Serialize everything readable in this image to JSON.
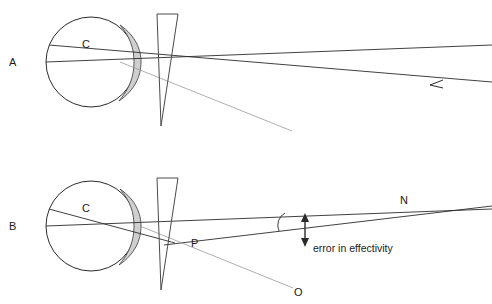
{
  "figure": {
    "title": "",
    "background_color": "#ffffff",
    "stroke_color": "#2b2b2b",
    "faint_stroke_color": "#9a9a9a",
    "cornea_fill_color": "#d0d0d0",
    "panels": [
      {
        "id": "A",
        "label": "A",
        "label_x": 12,
        "label_y": 66,
        "description": "eye with cornea, prism, and two parallel incoming rays"
      },
      {
        "id": "B",
        "label": "B",
        "label_x": 12,
        "label_y": 226,
        "description": "eye with cornea, prism, converging rays meeting at N, points P and O, error in effectivity annotation"
      }
    ],
    "point_labels": [
      {
        "text": "C",
        "x": 86,
        "y": 48,
        "panel": "A"
      },
      {
        "text": "C",
        "x": 86,
        "y": 212,
        "panel": "B"
      },
      {
        "text": "P",
        "x": 193,
        "y": 247,
        "panel": "B"
      },
      {
        "text": "N",
        "x": 402,
        "y": 204,
        "panel": "B"
      },
      {
        "text": "O",
        "x": 296,
        "y": 295,
        "panel": "B"
      }
    ],
    "annotations": [
      {
        "name": "error-in-effectivity",
        "text": "error in effectivity",
        "x": 313,
        "y": 251,
        "arrow": {
          "type": "double-headed-vertical",
          "x": 305,
          "y_top": 214,
          "y_bottom": 245
        }
      }
    ],
    "arrows": [
      {
        "name": "incoming-ray-arrowhead",
        "direction": "left",
        "x": 440,
        "y": 85,
        "panel": "A"
      }
    ],
    "angle_arc": {
      "name": "angle-arc",
      "cx": 272,
      "cy": 221,
      "r": 13,
      "panel": "B"
    },
    "eye_A": {
      "cx": 91,
      "cy": 62,
      "r": 45,
      "cornea": {
        "apex_x": 140,
        "top_y": 28,
        "bottom_y": 100
      }
    },
    "eye_B": {
      "cx": 91,
      "cy": 226,
      "r": 45,
      "cornea": {
        "apex_x": 140,
        "top_y": 192,
        "bottom_y": 264
      }
    },
    "prism_A": {
      "x1": 157,
      "y1": 14,
      "x2": 178,
      "y2": 14,
      "apex_x": 161,
      "apex_y": 126
    },
    "prism_B": {
      "x1": 157,
      "y1": 178,
      "x2": 178,
      "y2": 178,
      "apex_x": 161,
      "apex_y": 290
    }
  }
}
